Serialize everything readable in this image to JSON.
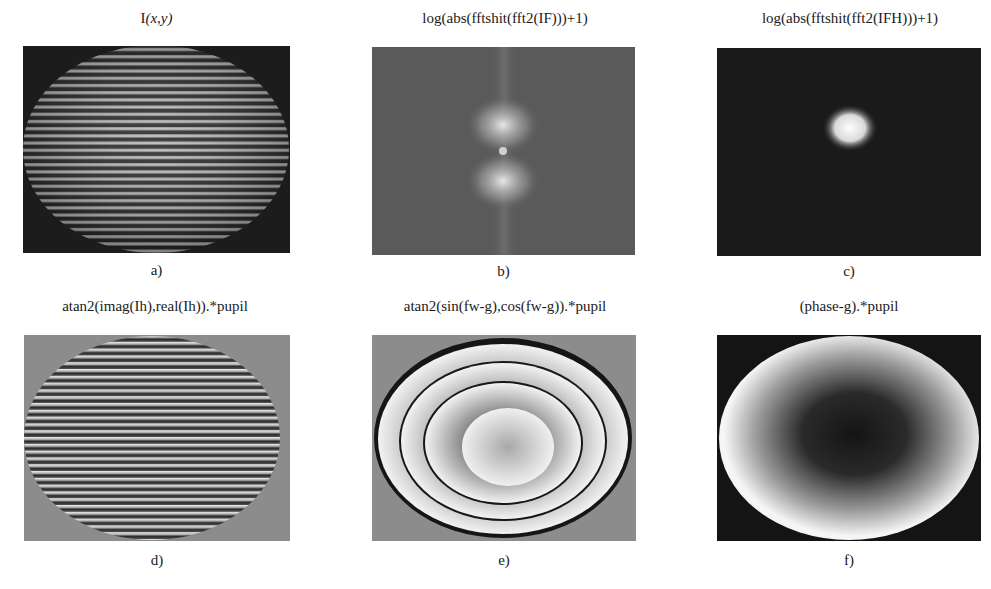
{
  "figure": {
    "panels": [
      {
        "id": "a",
        "title": "I(x,y)",
        "title_plain": "I",
        "title_italic": "(x,y)",
        "label": "a)",
        "description": "interferogram with horizontal curved fringes inside elliptical pupil on dark background"
      },
      {
        "id": "b",
        "title": "log(abs(fftshit(fft2(IF)))+1)",
        "label": "b)",
        "description": "Fourier spectrum with central DC spot and two symmetric side lobes above and below on gray noisy background"
      },
      {
        "id": "c",
        "title": "log(abs(fftshit(fft2(IFH)))+1)",
        "label": "c)",
        "description": "filtered spectrum with single bright lobe on dark background"
      },
      {
        "id": "d",
        "title": "atan2(imag(Ih),real(Ih)).*pupil",
        "label": "d)",
        "description": "wrapped phase with dense horizontal fringes inside elliptical pupil on gray background"
      },
      {
        "id": "e",
        "title": "atan2(sin(fw-g),cos(fw-g)).*pupil",
        "label": "e)",
        "description": "wrapped phase with concentric elliptical rings on gray background"
      },
      {
        "id": "f",
        "title": "(phase-g).*pupil",
        "label": "f)",
        "description": "unwrapped phase: dark center fading to bright edge inside ellipse on black background"
      }
    ]
  },
  "colors": {
    "background": "#ffffff",
    "text": "#1a1a1a",
    "dark_bg": "#1c1c1c",
    "gray_bg": "#8a8a8a",
    "spectrum_bg": "#5a5a5a"
  }
}
